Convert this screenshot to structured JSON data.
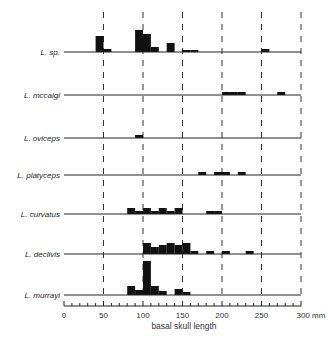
{
  "chart_data": {
    "type": "bar",
    "title": "",
    "xlabel": "basal skull length",
    "xunit": "mm",
    "xlim": [
      0,
      300
    ],
    "xticks": [
      0,
      50,
      100,
      150,
      200,
      250,
      300
    ],
    "xtick_labels": [
      "0",
      "50",
      "100",
      "150",
      "200",
      "250",
      "300 mm"
    ],
    "grid": "vertical dashed at 50 mm intervals",
    "bin_width": 10,
    "series": [
      {
        "name": "L. sp.",
        "bins": [
          [
            40,
            16
          ],
          [
            50,
            3
          ],
          [
            90,
            22
          ],
          [
            100,
            18
          ],
          [
            110,
            5
          ],
          [
            130,
            9
          ],
          [
            150,
            2
          ],
          [
            160,
            2
          ],
          [
            250,
            3
          ]
        ]
      },
      {
        "name": "L. mccaigi",
        "bins": [
          [
            200,
            3
          ],
          [
            210,
            3
          ],
          [
            220,
            3
          ],
          [
            270,
            3
          ]
        ]
      },
      {
        "name": "L. oviceps",
        "bins": [
          [
            90,
            3
          ]
        ]
      },
      {
        "name": "L. platyceps",
        "bins": [
          [
            170,
            3
          ],
          [
            190,
            3
          ],
          [
            200,
            3
          ],
          [
            220,
            3
          ]
        ]
      },
      {
        "name": "L. curvatus",
        "bins": [
          [
            80,
            6
          ],
          [
            90,
            3
          ],
          [
            100,
            6
          ],
          [
            110,
            3
          ],
          [
            120,
            6
          ],
          [
            130,
            3
          ],
          [
            140,
            6
          ],
          [
            180,
            3
          ],
          [
            190,
            3
          ]
        ]
      },
      {
        "name": "L. declivis",
        "bins": [
          [
            100,
            11
          ],
          [
            110,
            7
          ],
          [
            120,
            9
          ],
          [
            130,
            11
          ],
          [
            140,
            9
          ],
          [
            150,
            11
          ],
          [
            160,
            3
          ],
          [
            180,
            3
          ],
          [
            200,
            3
          ],
          [
            230,
            3
          ]
        ]
      },
      {
        "name": "L. murrayi",
        "bins": [
          [
            80,
            9
          ],
          [
            90,
            5
          ],
          [
            100,
            34
          ],
          [
            110,
            9
          ],
          [
            120,
            4
          ],
          [
            140,
            6
          ],
          [
            150,
            3
          ]
        ]
      }
    ]
  },
  "labels": {
    "rows": [
      "L. sp.",
      "L. mccaigi",
      "L. oviceps",
      "L. platyceps",
      "L. curvatus",
      "L. declivis",
      "L. murrayi"
    ],
    "xlabel": "basal skull length",
    "ticks": [
      "0",
      "50",
      "100",
      "150",
      "200",
      "250",
      "300 mm"
    ]
  }
}
